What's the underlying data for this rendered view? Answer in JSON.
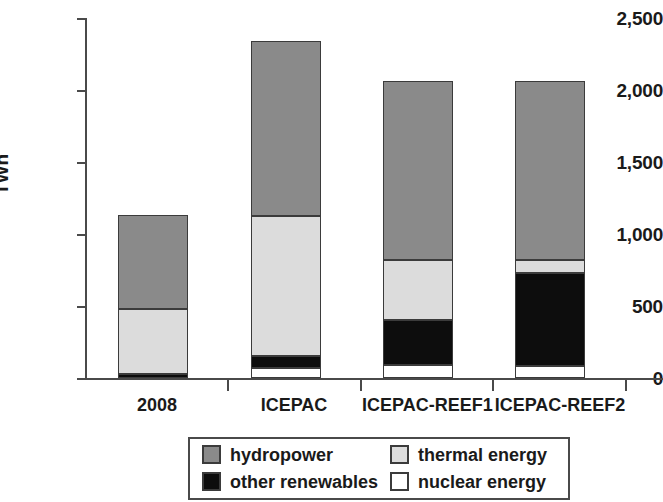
{
  "chart_data": {
    "type": "bar",
    "subtype": "stacked-bar",
    "title": "",
    "xlabel": "",
    "ylabel": "TWh",
    "ylim": [
      0,
      2500
    ],
    "yticks": [
      0,
      500,
      1000,
      1500,
      2000,
      2500
    ],
    "ytick_labels": [
      "0",
      "500",
      "1,000",
      "1,500",
      "2,000",
      "2,500"
    ],
    "grid": false,
    "legend_position": "bottom",
    "categories": [
      "2008",
      "ICEPAC",
      "ICEPAC-REEF1",
      "ICEPAC-REEF2"
    ],
    "series": [
      {
        "name": "nuclear energy",
        "color": "#ffffff",
        "values": [
          0,
          70,
          90,
          80
        ]
      },
      {
        "name": "other renewables",
        "color": "#0d0d0d",
        "values": [
          30,
          85,
          310,
          650
        ]
      },
      {
        "name": "thermal energy",
        "color": "#dcdcdc",
        "values": [
          450,
          970,
          420,
          90
        ]
      },
      {
        "name": "hydropower",
        "color": "#8a8a8a",
        "values": [
          655,
          1215,
          1240,
          1240
        ]
      }
    ],
    "totals": [
      1135,
      2340,
      2060,
      2060
    ],
    "stack_order_bottom_to_top": [
      "nuclear energy",
      "other renewables",
      "thermal energy",
      "hydropower"
    ],
    "annotations": []
  },
  "axes": {
    "y_title": "TWh",
    "y_ticks": [
      {
        "label": "2,500",
        "value": 2500
      },
      {
        "label": "2,000",
        "value": 2000
      },
      {
        "label": "1,500",
        "value": 1500
      },
      {
        "label": "1,000",
        "value": 1000
      },
      {
        "label": "500",
        "value": 500
      },
      {
        "label": "0",
        "value": 0
      }
    ],
    "x_ticks": [
      "2008",
      "ICEPAC",
      "ICEPAC-REEF1",
      "ICEPAC-REEF2"
    ]
  },
  "legend": {
    "items": [
      {
        "label": "hydropower",
        "color": "#8a8a8a"
      },
      {
        "label": "thermal energy",
        "color": "#dcdcdc"
      },
      {
        "label": "other renewables",
        "color": "#0d0d0d"
      },
      {
        "label": "nuclear energy",
        "color": "#ffffff"
      }
    ]
  }
}
